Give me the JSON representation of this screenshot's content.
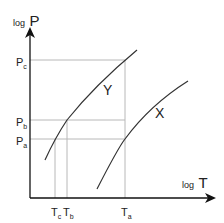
{
  "axes": {
    "y_label_prefix": "log",
    "y_label_var": "P",
    "x_label_prefix": "log",
    "x_label_var": "T"
  },
  "y_ticks": [
    {
      "main": "P",
      "sub": "c"
    },
    {
      "main": "P",
      "sub": "b"
    },
    {
      "main": "P",
      "sub": "a"
    }
  ],
  "x_ticks": [
    {
      "main": "T",
      "sub": "c"
    },
    {
      "main": "T",
      "sub": "b"
    },
    {
      "main": "T",
      "sub": "a"
    }
  ],
  "curves": {
    "y_label": "Y",
    "x_label": "X"
  },
  "colors": {
    "axis": "#111111",
    "curve": "#333333",
    "guide": "#b8b8b8"
  }
}
